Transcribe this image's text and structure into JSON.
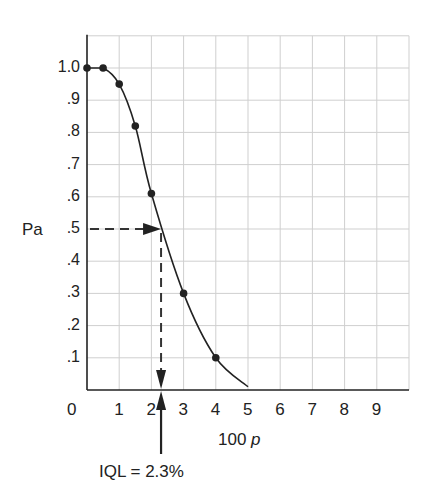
{
  "chart_data": {
    "type": "line",
    "title": "",
    "xlabel": "100 p",
    "ylabel": "Pa",
    "xlim": [
      0,
      10
    ],
    "ylim": [
      0,
      1.1
    ],
    "grid": true,
    "x_ticks": [
      "0",
      "1",
      "2",
      "3",
      "4",
      "5",
      "6",
      "7",
      "8",
      "9"
    ],
    "y_ticks": [
      ".1",
      ".2",
      ".3",
      ".4",
      ".5",
      ".6",
      ".7",
      ".8",
      ".9",
      "1.0"
    ],
    "series": [
      {
        "name": "OC curve",
        "points": [
          {
            "x": 0.0,
            "y": 1.0
          },
          {
            "x": 0.5,
            "y": 1.0
          },
          {
            "x": 1.0,
            "y": 0.95
          },
          {
            "x": 1.5,
            "y": 0.82
          },
          {
            "x": 2.0,
            "y": 0.61
          },
          {
            "x": 3.0,
            "y": 0.3
          },
          {
            "x": 4.0,
            "y": 0.1
          }
        ],
        "curve_end": {
          "x": 5.0,
          "y": 0.01
        }
      }
    ],
    "annotations": [
      {
        "type": "dashed-arrow-horizontal",
        "y": 0.5,
        "from_x": 0,
        "to_x": 2.3
      },
      {
        "type": "dashed-arrow-vertical",
        "x": 2.3,
        "from_y": 0.5,
        "to_y": 0
      },
      {
        "type": "solid-arrow-up",
        "x": 2.3,
        "text": "IQL = 2.3%"
      }
    ]
  },
  "labels": {
    "y_axis": "Pa",
    "x_axis_main": "100 ",
    "x_axis_var": "p",
    "iql": "IQL = 2.3%",
    "origin": "0"
  }
}
